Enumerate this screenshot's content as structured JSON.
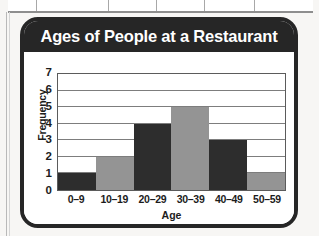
{
  "card": {
    "title": "Ages of People at a Restaurant"
  },
  "chart_data": {
    "type": "bar",
    "title": "Ages of People at a Restaurant",
    "xlabel": "Age",
    "ylabel": "Frequency",
    "categories": [
      "0–9",
      "10–19",
      "20–29",
      "30–39",
      "40–49",
      "50–59"
    ],
    "values": [
      1,
      2,
      4,
      5,
      3,
      1
    ],
    "bar_colors": [
      "#2d2d2d",
      "#949494",
      "#2d2d2d",
      "#949494",
      "#2d2d2d",
      "#949494"
    ],
    "ylim": [
      0,
      7
    ],
    "yticks": [
      0,
      1,
      2,
      3,
      4,
      5,
      6,
      7
    ],
    "ytick_labels": [
      "0",
      "1",
      "2",
      "3",
      "4",
      "5",
      "6",
      "7"
    ],
    "grid": true,
    "grid_axis": "y",
    "legend": null,
    "bar_gap": 0
  },
  "colors": {
    "header_bg": "#262626",
    "header_text": "#ffffff",
    "plot_bg": "#ffffff",
    "axis": "#5b5b5b",
    "gridline": "#7d7d7d",
    "dark_bar": "#2d2d2d",
    "gray_bar": "#949494",
    "text": "#1c1c1c"
  }
}
